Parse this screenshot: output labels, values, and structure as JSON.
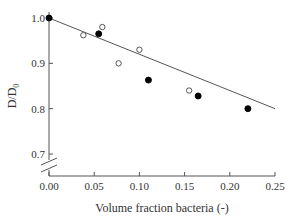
{
  "chart_data": {
    "type": "scatter",
    "title": "",
    "xlabel": "Volume fraction bacteria (-)",
    "ylabel": "D/D0",
    "ylabel_main": "D/D",
    "ylabel_sub": "0",
    "xlim": [
      0.0,
      0.25
    ],
    "ylim": [
      0.7,
      1.0
    ],
    "y_axis_break": true,
    "grid": false,
    "xticks": [
      "0.00",
      "0.05",
      "0.10",
      "0.15",
      "0.20",
      "0.25"
    ],
    "yticks": [
      "0.7",
      "0.8",
      "0.9",
      "1.0"
    ],
    "series": [
      {
        "name": "filled",
        "marker": "filled-circle",
        "x": [
          0.0,
          0.055,
          0.11,
          0.165,
          0.22
        ],
        "y": [
          1.0,
          0.965,
          0.863,
          0.828,
          0.8
        ]
      },
      {
        "name": "open",
        "marker": "open-circle",
        "x": [
          0.038,
          0.059,
          0.077,
          0.1,
          0.155
        ],
        "y": [
          0.962,
          0.98,
          0.9,
          0.93,
          0.84
        ]
      },
      {
        "name": "fit",
        "marker": "line",
        "x": [
          0.0,
          0.25
        ],
        "y": [
          1.0,
          0.8
        ]
      }
    ]
  }
}
